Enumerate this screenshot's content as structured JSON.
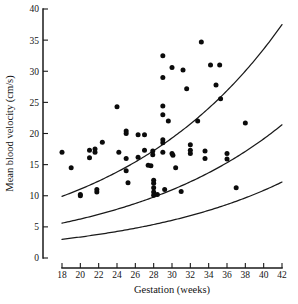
{
  "chart_data": {
    "type": "scatter",
    "title": "",
    "xlabel": "Gestation (weeks)",
    "ylabel": "Mean blood velocity (cm/s)",
    "xlim": [
      18,
      42
    ],
    "ylim": [
      0,
      40
    ],
    "xticks": [
      18,
      20,
      22,
      24,
      26,
      28,
      30,
      32,
      34,
      36,
      38,
      40,
      42
    ],
    "yticks": [
      0,
      5,
      10,
      15,
      20,
      25,
      30,
      35,
      40
    ],
    "xtick_labels": [
      "18",
      "20",
      "22",
      "24",
      "26",
      "28",
      "30",
      "32",
      "34",
      "36",
      "38",
      "40",
      "42"
    ],
    "ytick_labels": [
      "0",
      "5",
      "10",
      "15",
      "20",
      "25",
      "30",
      "35",
      "40"
    ],
    "grid": false,
    "legend": "none",
    "marker": "filled-circle",
    "marker_color": "#0b0b0b",
    "axis_color": "#1a1a1a",
    "curve_color": "#1a1a1a",
    "points": [
      {
        "x": 18.0,
        "y": 17.0
      },
      {
        "x": 19.0,
        "y": 14.5
      },
      {
        "x": 20.0,
        "y": 10.2
      },
      {
        "x": 20.0,
        "y": 10.0
      },
      {
        "x": 21.0,
        "y": 17.3
      },
      {
        "x": 21.0,
        "y": 16.1
      },
      {
        "x": 21.6,
        "y": 17.5
      },
      {
        "x": 21.6,
        "y": 17.0
      },
      {
        "x": 21.8,
        "y": 11.0
      },
      {
        "x": 21.8,
        "y": 10.6
      },
      {
        "x": 22.4,
        "y": 18.6
      },
      {
        "x": 24.0,
        "y": 24.3
      },
      {
        "x": 24.2,
        "y": 17.0
      },
      {
        "x": 25.0,
        "y": 20.4
      },
      {
        "x": 25.0,
        "y": 20.0
      },
      {
        "x": 25.0,
        "y": 16.0
      },
      {
        "x": 25.0,
        "y": 14.0
      },
      {
        "x": 25.2,
        "y": 12.1
      },
      {
        "x": 26.3,
        "y": 19.8
      },
      {
        "x": 26.3,
        "y": 16.2
      },
      {
        "x": 27.0,
        "y": 19.8
      },
      {
        "x": 27.0,
        "y": 17.3
      },
      {
        "x": 27.9,
        "y": 17.2
      },
      {
        "x": 27.9,
        "y": 16.6
      },
      {
        "x": 27.7,
        "y": 14.8
      },
      {
        "x": 28.0,
        "y": 12.5
      },
      {
        "x": 28.0,
        "y": 12.0
      },
      {
        "x": 28.0,
        "y": 11.3
      },
      {
        "x": 28.0,
        "y": 10.6
      },
      {
        "x": 28.0,
        "y": 10.1
      },
      {
        "x": 28.4,
        "y": 10.2
      },
      {
        "x": 27.4,
        "y": 14.9
      },
      {
        "x": 29.0,
        "y": 32.5
      },
      {
        "x": 29.0,
        "y": 29.0
      },
      {
        "x": 29.0,
        "y": 24.4
      },
      {
        "x": 29.0,
        "y": 23.0
      },
      {
        "x": 29.0,
        "y": 19.0
      },
      {
        "x": 29.0,
        "y": 18.5
      },
      {
        "x": 29.0,
        "y": 17.0
      },
      {
        "x": 29.2,
        "y": 11.0
      },
      {
        "x": 29.6,
        "y": 22.0
      },
      {
        "x": 30.0,
        "y": 30.6
      },
      {
        "x": 30.0,
        "y": 16.8
      },
      {
        "x": 30.1,
        "y": 16.5
      },
      {
        "x": 30.4,
        "y": 14.5
      },
      {
        "x": 31.2,
        "y": 30.2
      },
      {
        "x": 31.0,
        "y": 10.7
      },
      {
        "x": 31.6,
        "y": 27.2
      },
      {
        "x": 32.0,
        "y": 18.2
      },
      {
        "x": 32.0,
        "y": 17.3
      },
      {
        "x": 32.0,
        "y": 16.8
      },
      {
        "x": 32.8,
        "y": 22.0
      },
      {
        "x": 33.2,
        "y": 34.7
      },
      {
        "x": 33.6,
        "y": 17.2
      },
      {
        "x": 33.6,
        "y": 16.0
      },
      {
        "x": 34.2,
        "y": 31.0
      },
      {
        "x": 34.8,
        "y": 27.8
      },
      {
        "x": 35.2,
        "y": 31.0
      },
      {
        "x": 35.3,
        "y": 25.6
      },
      {
        "x": 36.0,
        "y": 16.8
      },
      {
        "x": 36.0,
        "y": 15.9
      },
      {
        "x": 37.0,
        "y": 11.3
      },
      {
        "x": 38.0,
        "y": 21.7
      }
    ],
    "curves": [
      {
        "name": "upper-centile",
        "x_start": 18,
        "x_end": 42,
        "y_start": 9.9,
        "y_end": 37.5
      },
      {
        "name": "median-centile",
        "x_start": 18,
        "x_end": 42,
        "y_start": 5.6,
        "y_end": 21.4
      },
      {
        "name": "lower-centile",
        "x_start": 18,
        "x_end": 42,
        "y_start": 3.0,
        "y_end": 12.2
      }
    ]
  }
}
